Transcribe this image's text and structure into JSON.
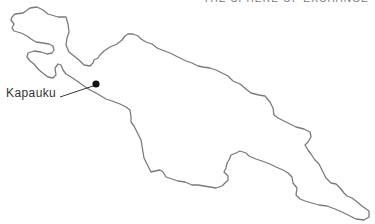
{
  "map": {
    "title_clipped": "THE SPHERE OF EXCHANGE",
    "region": "New Guinea",
    "outline_color": "#7a7a7a",
    "locations": [
      {
        "name": "Kapauku",
        "x": 96,
        "y": 84,
        "marker": "filled-circle"
      }
    ]
  }
}
